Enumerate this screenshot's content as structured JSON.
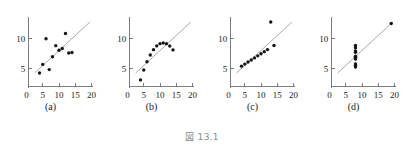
{
  "figure": {
    "caption": "図 13.1",
    "panel_labels": [
      "(a)",
      "(b)",
      "(c)",
      "(d)"
    ]
  },
  "axes": {
    "x_ticks": [
      0,
      5,
      10,
      15,
      20
    ],
    "x_tick_labels": [
      "0",
      "5",
      "10",
      "15",
      "20"
    ],
    "y_ticks": [
      5,
      10
    ],
    "y_tick_labels": [
      "5",
      "10"
    ],
    "xlim": [
      0,
      21
    ],
    "ylim": [
      1.8,
      13.6
    ],
    "grid": false
  },
  "colors": {
    "point": "#141414",
    "fit_line": "#9a9a9e",
    "axis": "#6f6f73",
    "tick_label": "#202020",
    "caption": "#8a8a8a",
    "background": "#ffffff"
  },
  "chart_data": [
    {
      "type": "scatter",
      "title": "(a)",
      "xlabel": "",
      "ylabel": "",
      "xlim": [
        0,
        21
      ],
      "ylim": [
        1.8,
        13.6
      ],
      "grid": false,
      "legend": "none",
      "x": [
        10,
        8,
        13,
        9,
        11,
        14,
        6,
        4,
        12,
        7,
        5
      ],
      "y": [
        8.04,
        6.95,
        7.58,
        8.81,
        8.33,
        7.66,
        9.96,
        4.26,
        10.84,
        4.82,
        5.68
      ],
      "fit_line": {
        "intercept": 3.0,
        "slope": 0.5,
        "x_start": 2.5,
        "x_end": 19.5
      }
    },
    {
      "type": "scatter",
      "title": "(b)",
      "xlabel": "",
      "ylabel": "",
      "xlim": [
        0,
        21
      ],
      "ylim": [
        1.8,
        13.6
      ],
      "grid": false,
      "legend": "none",
      "x": [
        10,
        8,
        13,
        9,
        11,
        14,
        6,
        4,
        12,
        7,
        5
      ],
      "y": [
        9.14,
        8.14,
        8.74,
        8.77,
        9.26,
        8.1,
        6.13,
        3.1,
        9.13,
        7.26,
        4.74
      ],
      "fit_line": {
        "intercept": 3.0,
        "slope": 0.5,
        "x_start": 2.5,
        "x_end": 19.5
      }
    },
    {
      "type": "scatter",
      "title": "(c)",
      "xlabel": "",
      "ylabel": "",
      "xlim": [
        0,
        21
      ],
      "ylim": [
        1.8,
        13.6
      ],
      "grid": false,
      "legend": "none",
      "x": [
        10,
        8,
        13,
        9,
        11,
        14,
        6,
        4,
        12,
        7,
        5
      ],
      "y": [
        7.46,
        6.77,
        12.74,
        7.11,
        7.81,
        8.84,
        6.08,
        5.39,
        8.15,
        6.42,
        5.73
      ],
      "fit_line": {
        "intercept": 3.0,
        "slope": 0.5,
        "x_start": 2.5,
        "x_end": 19.5
      }
    },
    {
      "type": "scatter",
      "title": "(d)",
      "xlabel": "",
      "ylabel": "",
      "xlim": [
        0,
        21
      ],
      "ylim": [
        1.8,
        13.6
      ],
      "grid": false,
      "legend": "none",
      "x": [
        8,
        8,
        8,
        8,
        8,
        8,
        8,
        19,
        8,
        8,
        8
      ],
      "y": [
        6.58,
        5.76,
        7.71,
        8.84,
        8.47,
        7.04,
        5.25,
        12.5,
        5.56,
        7.91,
        6.89
      ],
      "fit_line": {
        "intercept": 3.0,
        "slope": 0.5,
        "x_start": 2.5,
        "x_end": 19.5
      }
    }
  ]
}
